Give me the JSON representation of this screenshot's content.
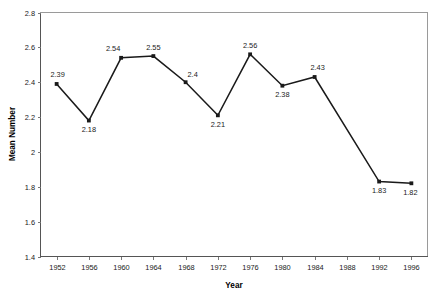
{
  "chart_data": {
    "type": "line",
    "title": "",
    "xlabel": "Year",
    "ylabel": "Mean Number",
    "categories": [
      "1952",
      "1956",
      "1960",
      "1964",
      "1968",
      "1972",
      "1976",
      "1980",
      "1984",
      "1988",
      "1992",
      "1996"
    ],
    "values": [
      2.39,
      2.18,
      2.54,
      2.55,
      2.4,
      2.21,
      2.56,
      2.38,
      2.43,
      null,
      1.83,
      1.82
    ],
    "point_labels": [
      "2.39",
      "2.18",
      "2.54",
      "2.55",
      "2.4",
      "2.21",
      "2.56",
      "2.38",
      "2.43",
      "",
      "1.83",
      "1.82"
    ],
    "label_positions": [
      "above",
      "below",
      "above",
      "above",
      "above",
      "below",
      "above",
      "below",
      "above",
      "",
      "below",
      "below"
    ],
    "ylim": [
      1.4,
      2.8
    ],
    "y_ticks": [
      "1.4",
      "1.6",
      "1.8",
      "2",
      "2.2",
      "2.4",
      "2.6",
      "2.8"
    ],
    "y_tick_values": [
      1.4,
      1.6,
      1.8,
      2.0,
      2.2,
      2.4,
      2.6,
      2.8
    ],
    "x_ticks": [
      "1952",
      "1956",
      "1960",
      "1964",
      "1968",
      "1972",
      "1976",
      "1980",
      "1984",
      "1988",
      "1992",
      "1996"
    ],
    "grid": false,
    "legend": "none",
    "series": [
      {
        "name": "Mean Number",
        "values": [
          2.39,
          2.18,
          2.54,
          2.55,
          2.4,
          2.21,
          2.56,
          2.38,
          2.43,
          null,
          1.83,
          1.82
        ],
        "line_color": "#1a1a1a",
        "marker": "square"
      }
    ],
    "colors": {
      "line": "#1a1a1a",
      "marker": "#1a1a1a",
      "border": "#9a9a9a",
      "axis": "#555555",
      "text": "#1a1a1a",
      "background": "#ffffff"
    }
  }
}
